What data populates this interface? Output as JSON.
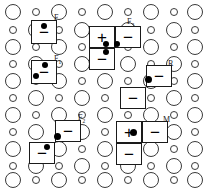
{
  "figure": {
    "width": 207,
    "height": 188,
    "background": "#ffffff",
    "stroke_color": "#3a3a3a",
    "cell_stroke_color": "#1a1a1a",
    "dot_color": "#000000"
  },
  "lattice": {
    "description": "Alternating large and small open circles arranged on a staggered grid",
    "large_radius_px": 8,
    "small_radius_px": 4,
    "col_spacing_px": 23,
    "row_spacing_px": 17,
    "columns": 9,
    "rows": 11,
    "circles": [
      {
        "cx": 13,
        "cy": 12,
        "size": "big"
      },
      {
        "cx": 36,
        "cy": 12,
        "size": "small"
      },
      {
        "cx": 59,
        "cy": 12,
        "size": "big"
      },
      {
        "cx": 82,
        "cy": 12,
        "size": "small"
      },
      {
        "cx": 105,
        "cy": 12,
        "size": "big"
      },
      {
        "cx": 128,
        "cy": 12,
        "size": "small"
      },
      {
        "cx": 151,
        "cy": 12,
        "size": "big"
      },
      {
        "cx": 174,
        "cy": 12,
        "size": "small"
      },
      {
        "cx": 195,
        "cy": 12,
        "size": "big"
      },
      {
        "cx": 13,
        "cy": 30,
        "size": "small"
      },
      {
        "cx": 36,
        "cy": 30,
        "size": "big"
      },
      {
        "cx": 59,
        "cy": 30,
        "size": "small"
      },
      {
        "cx": 82,
        "cy": 30,
        "size": "big"
      },
      {
        "cx": 105,
        "cy": 30,
        "size": "small"
      },
      {
        "cx": 128,
        "cy": 30,
        "size": "big"
      },
      {
        "cx": 151,
        "cy": 30,
        "size": "small"
      },
      {
        "cx": 174,
        "cy": 30,
        "size": "big"
      },
      {
        "cx": 195,
        "cy": 30,
        "size": "small"
      },
      {
        "cx": 13,
        "cy": 47,
        "size": "big"
      },
      {
        "cx": 36,
        "cy": 47,
        "size": "small"
      },
      {
        "cx": 59,
        "cy": 47,
        "size": "big"
      },
      {
        "cx": 82,
        "cy": 47,
        "size": "small"
      },
      {
        "cx": 105,
        "cy": 47,
        "size": "big"
      },
      {
        "cx": 128,
        "cy": 47,
        "size": "small"
      },
      {
        "cx": 151,
        "cy": 47,
        "size": "big"
      },
      {
        "cx": 174,
        "cy": 47,
        "size": "small"
      },
      {
        "cx": 195,
        "cy": 47,
        "size": "big"
      },
      {
        "cx": 13,
        "cy": 64,
        "size": "small"
      },
      {
        "cx": 36,
        "cy": 64,
        "size": "big"
      },
      {
        "cx": 59,
        "cy": 64,
        "size": "small"
      },
      {
        "cx": 82,
        "cy": 64,
        "size": "big"
      },
      {
        "cx": 105,
        "cy": 64,
        "size": "small"
      },
      {
        "cx": 128,
        "cy": 64,
        "size": "big"
      },
      {
        "cx": 151,
        "cy": 64,
        "size": "small"
      },
      {
        "cx": 174,
        "cy": 64,
        "size": "big"
      },
      {
        "cx": 195,
        "cy": 64,
        "size": "small"
      },
      {
        "cx": 13,
        "cy": 81,
        "size": "big"
      },
      {
        "cx": 36,
        "cy": 81,
        "size": "small"
      },
      {
        "cx": 59,
        "cy": 81,
        "size": "big"
      },
      {
        "cx": 82,
        "cy": 81,
        "size": "small"
      },
      {
        "cx": 105,
        "cy": 81,
        "size": "big"
      },
      {
        "cx": 128,
        "cy": 81,
        "size": "small"
      },
      {
        "cx": 151,
        "cy": 81,
        "size": "big"
      },
      {
        "cx": 174,
        "cy": 81,
        "size": "small"
      },
      {
        "cx": 195,
        "cy": 81,
        "size": "big"
      },
      {
        "cx": 13,
        "cy": 98,
        "size": "small"
      },
      {
        "cx": 36,
        "cy": 98,
        "size": "big"
      },
      {
        "cx": 59,
        "cy": 98,
        "size": "small"
      },
      {
        "cx": 82,
        "cy": 98,
        "size": "big"
      },
      {
        "cx": 105,
        "cy": 98,
        "size": "small"
      },
      {
        "cx": 128,
        "cy": 98,
        "size": "big"
      },
      {
        "cx": 151,
        "cy": 98,
        "size": "small"
      },
      {
        "cx": 174,
        "cy": 98,
        "size": "big"
      },
      {
        "cx": 195,
        "cy": 98,
        "size": "small"
      },
      {
        "cx": 13,
        "cy": 115,
        "size": "big"
      },
      {
        "cx": 36,
        "cy": 115,
        "size": "small"
      },
      {
        "cx": 59,
        "cy": 115,
        "size": "big"
      },
      {
        "cx": 82,
        "cy": 115,
        "size": "small"
      },
      {
        "cx": 105,
        "cy": 115,
        "size": "big"
      },
      {
        "cx": 128,
        "cy": 115,
        "size": "small"
      },
      {
        "cx": 151,
        "cy": 115,
        "size": "big"
      },
      {
        "cx": 174,
        "cy": 115,
        "size": "small"
      },
      {
        "cx": 195,
        "cy": 115,
        "size": "big"
      },
      {
        "cx": 13,
        "cy": 132,
        "size": "small"
      },
      {
        "cx": 36,
        "cy": 132,
        "size": "big"
      },
      {
        "cx": 59,
        "cy": 132,
        "size": "small"
      },
      {
        "cx": 82,
        "cy": 132,
        "size": "big"
      },
      {
        "cx": 105,
        "cy": 132,
        "size": "small"
      },
      {
        "cx": 128,
        "cy": 132,
        "size": "big"
      },
      {
        "cx": 151,
        "cy": 132,
        "size": "small"
      },
      {
        "cx": 174,
        "cy": 132,
        "size": "big"
      },
      {
        "cx": 195,
        "cy": 132,
        "size": "small"
      },
      {
        "cx": 13,
        "cy": 149,
        "size": "big"
      },
      {
        "cx": 36,
        "cy": 149,
        "size": "small"
      },
      {
        "cx": 59,
        "cy": 149,
        "size": "big"
      },
      {
        "cx": 82,
        "cy": 149,
        "size": "small"
      },
      {
        "cx": 105,
        "cy": 149,
        "size": "big"
      },
      {
        "cx": 128,
        "cy": 149,
        "size": "small"
      },
      {
        "cx": 151,
        "cy": 149,
        "size": "big"
      },
      {
        "cx": 174,
        "cy": 149,
        "size": "small"
      },
      {
        "cx": 195,
        "cy": 149,
        "size": "big"
      },
      {
        "cx": 13,
        "cy": 166,
        "size": "small"
      },
      {
        "cx": 36,
        "cy": 166,
        "size": "big"
      },
      {
        "cx": 59,
        "cy": 166,
        "size": "small"
      },
      {
        "cx": 82,
        "cy": 166,
        "size": "big"
      },
      {
        "cx": 105,
        "cy": 166,
        "size": "small"
      },
      {
        "cx": 128,
        "cy": 166,
        "size": "big"
      },
      {
        "cx": 151,
        "cy": 166,
        "size": "small"
      },
      {
        "cx": 174,
        "cy": 166,
        "size": "big"
      },
      {
        "cx": 195,
        "cy": 166,
        "size": "small"
      },
      {
        "cx": 13,
        "cy": 180,
        "size": "big"
      },
      {
        "cx": 36,
        "cy": 180,
        "size": "small"
      },
      {
        "cx": 59,
        "cy": 180,
        "size": "big"
      },
      {
        "cx": 82,
        "cy": 180,
        "size": "small"
      },
      {
        "cx": 105,
        "cy": 180,
        "size": "big"
      },
      {
        "cx": 128,
        "cy": 180,
        "size": "small"
      },
      {
        "cx": 151,
        "cy": 180,
        "size": "big"
      },
      {
        "cx": 174,
        "cy": 180,
        "size": "small"
      },
      {
        "cx": 195,
        "cy": 180,
        "size": "big"
      }
    ]
  },
  "cells": [
    {
      "id": "cell-f-a",
      "x": 31,
      "y": 20,
      "w": 26,
      "h": 24,
      "symbol": "−"
    },
    {
      "id": "cell-f1-a",
      "x": 31,
      "y": 60,
      "w": 26,
      "h": 24,
      "symbol": "−"
    },
    {
      "id": "cell-f3-tl",
      "x": 89,
      "y": 26,
      "w": 26,
      "h": 22,
      "symbol": "+"
    },
    {
      "id": "cell-f3-tr",
      "x": 115,
      "y": 26,
      "w": 26,
      "h": 22,
      "symbol": "−"
    },
    {
      "id": "cell-f3-bl",
      "x": 89,
      "y": 48,
      "w": 26,
      "h": 22,
      "symbol": "−"
    },
    {
      "id": "cell-r-top",
      "x": 146,
      "y": 65,
      "w": 26,
      "h": 22,
      "symbol": "−"
    },
    {
      "id": "cell-r-bot",
      "x": 120,
      "y": 87,
      "w": 26,
      "h": 22,
      "symbol": "−"
    },
    {
      "id": "cell-f2-top",
      "x": 55,
      "y": 120,
      "w": 26,
      "h": 22,
      "symbol": "−"
    },
    {
      "id": "cell-f2-bot",
      "x": 29,
      "y": 142,
      "w": 26,
      "h": 22,
      "symbol": "−"
    },
    {
      "id": "cell-m-tl",
      "x": 116,
      "y": 121,
      "w": 26,
      "h": 22,
      "symbol": "+"
    },
    {
      "id": "cell-m-tr",
      "x": 142,
      "y": 121,
      "w": 26,
      "h": 22,
      "symbol": "−"
    },
    {
      "id": "cell-m-bl",
      "x": 116,
      "y": 143,
      "w": 26,
      "h": 22,
      "symbol": "−"
    }
  ],
  "dots": [
    {
      "id": "dot-f-a",
      "cx": 44,
      "cy": 26,
      "r": 3
    },
    {
      "id": "dot-f1-a1",
      "cx": 45,
      "cy": 65,
      "r": 3
    },
    {
      "id": "dot-f1-a2",
      "cx": 36,
      "cy": 76,
      "r": 3
    },
    {
      "id": "dot-f3-1",
      "cx": 106,
      "cy": 44,
      "r": 3
    },
    {
      "id": "dot-f3-2",
      "cx": 117,
      "cy": 44,
      "r": 3
    },
    {
      "id": "dot-f3-3",
      "cx": 106,
      "cy": 52,
      "r": 3
    },
    {
      "id": "dot-r",
      "cx": 148,
      "cy": 79,
      "r": 3.5
    },
    {
      "id": "dot-f2-1",
      "cx": 57,
      "cy": 136,
      "r": 3.5
    },
    {
      "id": "dot-f2-2",
      "cx": 47,
      "cy": 147,
      "r": 3
    },
    {
      "id": "dot-m",
      "cx": 133,
      "cy": 132,
      "r": 3.5
    }
  ],
  "labels": [
    {
      "id": "label-f",
      "x": 54,
      "y": 14,
      "text": "F",
      "sub": ""
    },
    {
      "id": "label-f1",
      "x": 54,
      "y": 55,
      "text": "F",
      "sub": "1"
    },
    {
      "id": "label-f3",
      "x": 127,
      "y": 18,
      "text": "F",
      "sub": "3"
    },
    {
      "id": "label-r",
      "x": 168,
      "y": 60,
      "text": "R",
      "sub": ""
    },
    {
      "id": "label-f2",
      "x": 78,
      "y": 114,
      "text": "F",
      "sub": "2"
    },
    {
      "id": "label-m",
      "x": 163,
      "y": 116,
      "text": "M",
      "sub": ""
    }
  ]
}
